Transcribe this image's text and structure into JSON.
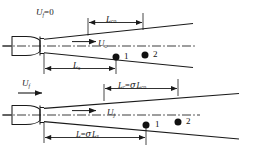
{
  "figure": {
    "type": "schematic-diagram",
    "background_color": "#ffffff",
    "line_color": "#1a1a1a",
    "marker_color": "#111111"
  },
  "panels": [
    {
      "id": "upper",
      "name": "quiescent-ambient-case",
      "labels": {
        "ambient_velocity": {
          "symbol": "U",
          "subscript": "f",
          "equals": "=0",
          "text": "U"
        },
        "jet_velocity": {
          "symbol": "U",
          "subscript": "o"
        },
        "top_dimension": {
          "symbol": "L",
          "subscript": "co"
        },
        "bottom_dimension": {
          "symbol": "L",
          "subscript": "s"
        }
      },
      "points": [
        {
          "label": "1"
        },
        {
          "label": "2"
        }
      ]
    },
    {
      "id": "lower",
      "name": "coflow-case",
      "labels": {
        "coflow_velocity": {
          "symbol": "U",
          "subscript": "f"
        },
        "jet_velocity": {
          "symbol": "U",
          "subscript": "j"
        },
        "top_dimension": {
          "lhs_symbol": "L",
          "lhs_subscript": "c",
          "equals": "=",
          "sigma": "σ",
          "rhs_symbol": "L",
          "rhs_subscript": "co"
        },
        "bottom_dimension": {
          "lhs_symbol": "L",
          "equals": "=",
          "sigma": "σ",
          "rhs_symbol": "L",
          "rhs_subscript": "s"
        }
      },
      "points": [
        {
          "label": "1"
        },
        {
          "label": "2"
        }
      ]
    }
  ],
  "symbols": {
    "sigma": "σ",
    "equals": "=",
    "zero": "0"
  }
}
